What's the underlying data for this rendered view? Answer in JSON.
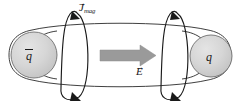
{
  "figure": {
    "kind": "physics-diagram",
    "background_color": "#ffffff",
    "stroke_color": "#1a1a1a",
    "sphere_fill_color": "#d4d4d4",
    "sphere_stroke_color": "#6e6e6e",
    "field_arrow_color": "#9a9a9a"
  },
  "labels": {
    "magnetic_current": {
      "symbol": "J",
      "subscript": "mag",
      "vector_arrow": "→",
      "full_text": "J⃗mag"
    },
    "electric_field": {
      "symbol": "E",
      "vector_arrow": "→",
      "full_text": "E⃗"
    },
    "left_charge": {
      "symbol": "q",
      "has_overbar": true,
      "full_text": "q̄",
      "meaning": "antiquark"
    },
    "right_charge": {
      "symbol": "q",
      "has_overbar": false,
      "full_text": "q",
      "meaning": "quark"
    }
  },
  "elements": {
    "flux_tube": "flux-tube-outline",
    "left_loop": "magnetic-current-loop-left",
    "right_loop": "magnetic-current-loop-right",
    "field_arrow": "electric-field-arrow"
  }
}
